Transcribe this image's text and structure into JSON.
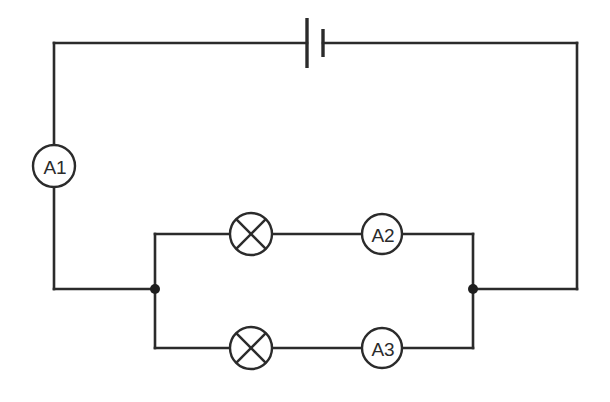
{
  "diagram": {
    "background_color": "#ffffff",
    "line_color": "#2b2b2b",
    "components": {
      "battery": {
        "name": "battery",
        "type": "cell",
        "label": "",
        "position": {
          "x": 314,
          "y": 43
        },
        "long_plate_x": 307,
        "short_plate_x": 323,
        "long_plate_half_height": 25,
        "short_plate_half_height": 14
      },
      "ammeter_a1": {
        "name": "ammeter",
        "label": "A1",
        "position": {
          "x": 54,
          "y": 166
        },
        "radius": 21
      },
      "ammeter_a2": {
        "name": "ammeter",
        "label": "A2",
        "position": {
          "x": 382,
          "y": 235
        },
        "radius": 20
      },
      "ammeter_a3": {
        "name": "ammeter",
        "label": "A3",
        "position": {
          "x": 382,
          "y": 348
        },
        "radius": 20
      },
      "lamp_top": {
        "name": "lamp",
        "label": "",
        "position": {
          "x": 251,
          "y": 235
        },
        "radius": 21
      },
      "lamp_bottom": {
        "name": "lamp",
        "label": "",
        "position": {
          "x": 251,
          "y": 348
        },
        "radius": 21
      },
      "junction_left": {
        "name": "junction-node",
        "position": {
          "x": 155,
          "y": 289
        },
        "radius": 5
      },
      "junction_right": {
        "name": "junction-node",
        "position": {
          "x": 473,
          "y": 289
        },
        "radius": 5
      }
    },
    "geometry": {
      "outer_left_x": 54,
      "outer_right_x": 577,
      "outer_top_y": 43,
      "outer_bottom_y": 289,
      "inner_left_x": 155,
      "inner_right_x": 473,
      "inner_top_y": 234,
      "inner_bottom_y": 348
    }
  }
}
